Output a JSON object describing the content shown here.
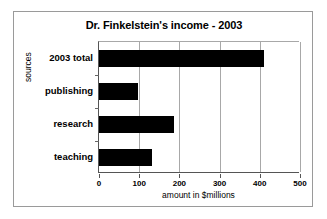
{
  "chart_data": {
    "type": "bar",
    "orientation": "horizontal",
    "title": "Dr. Finkelstein's income - 2003",
    "xlabel": "amount in $millions",
    "ylabel": "sources",
    "categories": [
      "2003 total",
      "publishing",
      "research",
      "teaching"
    ],
    "values": [
      410,
      97,
      186,
      131
    ],
    "xlim": [
      0,
      500
    ],
    "xticks": [
      0,
      100,
      200,
      300,
      400,
      500
    ],
    "xtick_labels": [
      "0",
      "100",
      "200",
      "300",
      "400",
      "500"
    ],
    "grid": "vertical",
    "legend": "none",
    "bar_color": "#000000",
    "series": [
      {
        "name": "income",
        "values": [
          410,
          97,
          186,
          131
        ]
      }
    ]
  },
  "chart": {
    "title": "Dr. Finkelstein's income - 2003",
    "x_axis_title": "amount in $millions",
    "y_axis_title": "sources",
    "categories": [
      {
        "label": "2003 total",
        "value": 410
      },
      {
        "label": "publishing",
        "value": 97
      },
      {
        "label": "research",
        "value": 186
      },
      {
        "label": "teaching",
        "value": 131
      }
    ],
    "x_ticks": [
      {
        "label": "0"
      },
      {
        "label": "100"
      },
      {
        "label": "200"
      },
      {
        "label": "300"
      },
      {
        "label": "400"
      },
      {
        "label": "500"
      }
    ]
  },
  "colors": {
    "bar": "#000000",
    "grid": "#a8a8a8",
    "axis": "#555555",
    "frame": "#9a9a9a",
    "background": "#ffffff"
  }
}
